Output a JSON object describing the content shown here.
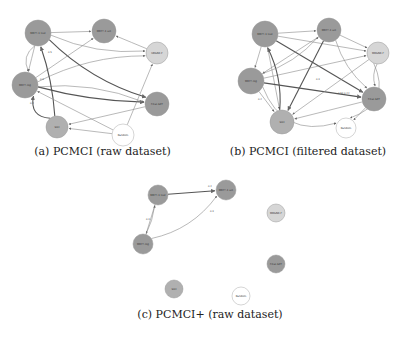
{
  "colors": {
    "node_dark": "#9a9a9a",
    "node_mid": "#b0b0b0",
    "node_light": "#d6d6d6",
    "node_white": "#ffffff",
    "edge": "#8a8a8a",
    "edge_strong": "#555555"
  },
  "panels": [
    {
      "id": "a",
      "caption": "(a) PCMCI (raw dataset)",
      "nodes": [
        {
          "id": "n1",
          "label": "MBF?-1 test",
          "x": 38,
          "y": 33,
          "r": 13,
          "shade": "dark"
        },
        {
          "id": "n2",
          "label": "MBF?-1 set",
          "x": 104,
          "y": 31,
          "r": 12,
          "shade": "dark"
        },
        {
          "id": "n3",
          "label": "URGNE-F",
          "x": 157,
          "y": 53,
          "r": 11,
          "shade": "light"
        },
        {
          "id": "n4",
          "label": "MBF?-log",
          "x": 25,
          "y": 85,
          "r": 13,
          "shade": "dark"
        },
        {
          "id": "n5",
          "label": "Final-SET",
          "x": 157,
          "y": 104,
          "r": 12,
          "shade": "dark"
        },
        {
          "id": "n6",
          "label": "Slot",
          "x": 57,
          "y": 127,
          "r": 11,
          "shade": "mid"
        },
        {
          "id": "n7",
          "label": "Random",
          "x": 123,
          "y": 135,
          "r": 11,
          "shade": "white"
        }
      ]
    },
    {
      "id": "b",
      "caption": "(b) PCMCI (filtered dataset)",
      "nodes": [
        {
          "id": "n1",
          "label": "MBF?-1 test",
          "x": 265,
          "y": 34,
          "r": 13,
          "shade": "dark"
        },
        {
          "id": "n2",
          "label": "MBF?-1 set",
          "x": 329,
          "y": 30,
          "r": 12,
          "shade": "dark"
        },
        {
          "id": "n3",
          "label": "MRGNE-F",
          "x": 378,
          "y": 53,
          "r": 11,
          "shade": "light"
        },
        {
          "id": "n4",
          "label": "MBF?-log",
          "x": 251,
          "y": 81,
          "r": 13,
          "shade": "dark"
        },
        {
          "id": "n5",
          "label": "Final-SET",
          "x": 374,
          "y": 99,
          "r": 12,
          "shade": "dark"
        },
        {
          "id": "n6",
          "label": "Slot",
          "x": 282,
          "y": 122,
          "r": 12,
          "shade": "mid"
        },
        {
          "id": "n7",
          "label": "Random",
          "x": 346,
          "y": 128,
          "r": 10,
          "shade": "white"
        }
      ]
    },
    {
      "id": "c",
      "caption": "(c) PCMCI+ (raw dataset)",
      "nodes": [
        {
          "id": "n1",
          "label": "MBF?-1 test",
          "x": 158,
          "y": 195,
          "r": 10,
          "shade": "dark"
        },
        {
          "id": "n2",
          "label": "MBF?-1 set",
          "x": 226,
          "y": 190,
          "r": 10,
          "shade": "dark"
        },
        {
          "id": "n3",
          "label": "MRGNE-F",
          "x": 276,
          "y": 213,
          "r": 9,
          "shade": "light"
        },
        {
          "id": "n4",
          "label": "MBF?-log",
          "x": 143,
          "y": 244,
          "r": 10,
          "shade": "dark"
        },
        {
          "id": "n5",
          "label": "Final-SET",
          "x": 276,
          "y": 264,
          "r": 9,
          "shade": "dark"
        },
        {
          "id": "n6",
          "label": "Slot",
          "x": 174,
          "y": 289,
          "r": 9,
          "shade": "mid"
        },
        {
          "id": "n7",
          "label": "Random",
          "x": 241,
          "y": 296,
          "r": 9,
          "shade": "white"
        }
      ]
    }
  ],
  "edges": {
    "a": [
      [
        "n1",
        "n2",
        0.0,
        "normal"
      ],
      [
        "n1",
        "n4",
        0.0,
        "normal"
      ],
      [
        "n1",
        "n3",
        0.1,
        "normal"
      ],
      [
        "n1",
        "n5",
        0.1,
        "strong"
      ],
      [
        "n4",
        "n2",
        0.0,
        "normal"
      ],
      [
        "n4",
        "n3",
        -0.1,
        "normal"
      ],
      [
        "n4",
        "n5",
        0.05,
        "strong"
      ],
      [
        "n4",
        "n5",
        -0.1,
        "normal"
      ],
      [
        "n6",
        "n1",
        0.05,
        "strong"
      ],
      [
        "n6",
        "n4",
        -0.3,
        "strong"
      ],
      [
        "n3",
        "n2",
        0.0,
        "normal"
      ],
      [
        "n7",
        "n3",
        0.0,
        "normal"
      ],
      [
        "n7",
        "n4",
        0.0,
        "normal"
      ],
      [
        "n7",
        "n6",
        0.0,
        "normal"
      ],
      [
        "n5",
        "n6",
        0.0,
        "normal"
      ],
      [
        "n1",
        "n4",
        0.2,
        "normal"
      ]
    ],
    "b": [
      [
        "n1",
        "n2",
        0.0,
        "normal"
      ],
      [
        "n1",
        "n4",
        0.0,
        "normal"
      ],
      [
        "n1",
        "n3",
        0.0,
        "normal"
      ],
      [
        "n1",
        "n5",
        0.0,
        "strong"
      ],
      [
        "n1",
        "n6",
        0.0,
        "normal"
      ],
      [
        "n2",
        "n4",
        0.0,
        "normal"
      ],
      [
        "n2",
        "n6",
        0.0,
        "strong"
      ],
      [
        "n2",
        "n5",
        0.1,
        "normal"
      ],
      [
        "n2",
        "n3",
        0.0,
        "normal"
      ],
      [
        "n4",
        "n3",
        0.0,
        "normal"
      ],
      [
        "n4",
        "n5",
        0.0,
        "strong"
      ],
      [
        "n4",
        "n6",
        0.0,
        "normal"
      ],
      [
        "n3",
        "n6",
        0.0,
        "normal"
      ],
      [
        "n3",
        "n5",
        0.1,
        "normal"
      ],
      [
        "n5",
        "n6",
        0.0,
        "normal"
      ],
      [
        "n5",
        "n7",
        0.0,
        "normal"
      ],
      [
        "n4",
        "n7",
        0.35,
        "normal"
      ],
      [
        "n3",
        "n7",
        -0.4,
        "normal"
      ],
      [
        "n6",
        "n1",
        0.1,
        "strong"
      ],
      [
        "n4",
        "n2",
        0.1,
        "normal"
      ]
    ],
    "c": [
      [
        "n1",
        "n2",
        0.0,
        "strong"
      ],
      [
        "n1",
        "n4",
        0.0,
        "normal"
      ],
      [
        "n4",
        "n1",
        0.05,
        "normal"
      ],
      [
        "n4",
        "n2",
        0.15,
        "normal"
      ]
    ]
  },
  "edge_labels": {
    "a": [
      {
        "text": "0.5",
        "x": 48,
        "y": 53
      },
      {
        "text": "0.3",
        "x": 40,
        "y": 80
      },
      {
        "text": "0.4",
        "x": 30,
        "y": 104
      }
    ],
    "b": [
      {
        "text": "0.52 0.44",
        "x": 338,
        "y": 94
      },
      {
        "text": "0.3",
        "x": 316,
        "y": 80
      },
      {
        "text": "0.4",
        "x": 258,
        "y": 100
      }
    ],
    "c": [
      {
        "text": "0.2",
        "x": 208,
        "y": 187
      },
      {
        "text": "0.3",
        "x": 146,
        "y": 220
      },
      {
        "text": "0.3",
        "x": 210,
        "y": 212
      }
    ]
  }
}
